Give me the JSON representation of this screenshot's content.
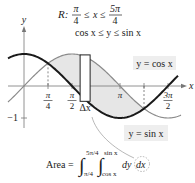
{
  "region": {
    "label": "R:",
    "x_lower": {
      "num": "π",
      "den": "4"
    },
    "x_var": "x",
    "x_upper": {
      "num": "5π",
      "den": "4"
    },
    "y_condition": "cos x ≤ y ≤ sin x",
    "leq": "≤"
  },
  "axes": {
    "x_label": "x",
    "y_label": "y",
    "y_tick_label": "−1",
    "x_ticks": [
      {
        "value": 0.7853981634,
        "num": "π",
        "den": "4",
        "dashed": true
      },
      {
        "value": 1.5707963268,
        "num": "π",
        "den": "2",
        "dashed": false
      },
      {
        "value": 3.1415926536,
        "num": "π",
        "den": "",
        "dashed": false
      },
      {
        "value": 3.926990817,
        "num": "",
        "den": "",
        "dashed": true
      },
      {
        "value": 4.7123889804,
        "num": "3π",
        "den": "2",
        "dashed": false
      }
    ],
    "x_range": [
      -0.5,
      5.0
    ],
    "y_range": [
      -1.3,
      1.7
    ]
  },
  "curves": {
    "cos": {
      "label": "y = cos x",
      "color": "#1a1a1a"
    },
    "sin": {
      "label": "y = sin x",
      "color": "#8a8a8a"
    }
  },
  "shading": {
    "from": 0.7853981634,
    "to": 3.926990817,
    "color": "#e6e6e6"
  },
  "strip": {
    "label": "Δx",
    "x_center": 2.0
  },
  "formula": {
    "prefix": "Area =",
    "outer_upper": "5π/4",
    "outer_lower": "π/4",
    "inner_upper": "sin x",
    "inner_lower": "cos x",
    "dy": "dy",
    "dx": "dx"
  },
  "colors": {
    "axis": "#777777",
    "label_box": "#eeeeee",
    "leader": "#999999"
  }
}
